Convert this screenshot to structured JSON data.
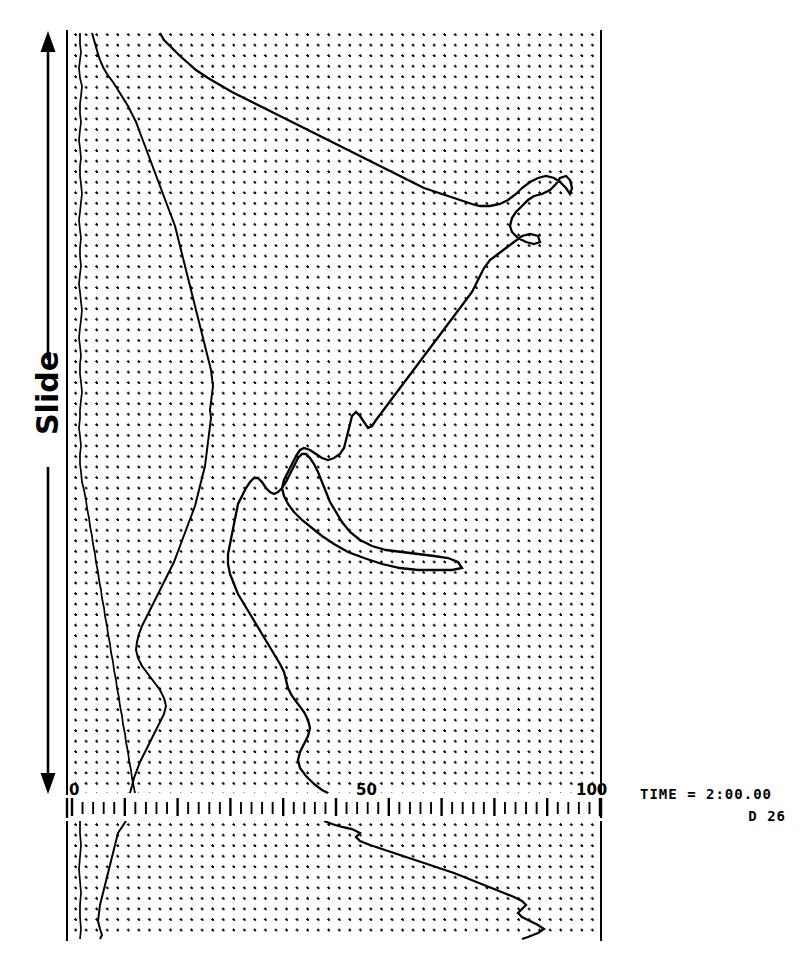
{
  "figure": {
    "kind": "vertical-profile-plot",
    "left_axis_label": "Slide",
    "annotation": {
      "time_label": "TIME = 2:00.00",
      "frame_label": "D  26"
    },
    "ink_color": "#000000",
    "background_color": "#ffffff",
    "grid": {
      "style": "dotted",
      "dot_spacing_px": 10.55,
      "visible": true
    }
  },
  "chart_data": {
    "type": "line",
    "title": "",
    "xlabel": "",
    "ylabel": "Slide",
    "xlim": [
      0,
      100
    ],
    "ylim": [
      0,
      1
    ],
    "grid": true,
    "legend_position": "none",
    "orientation": "vertical-profile",
    "xticks": [
      0,
      10,
      20,
      30,
      40,
      50,
      60,
      70,
      80,
      90,
      100
    ],
    "xtick_labels": [
      "0",
      "",
      "",
      "",
      "",
      "50",
      "",
      "",
      "",
      "",
      "100"
    ],
    "minor_tick_interval": 2,
    "major_tick_interval": 10,
    "series": [
      {
        "name": "profile-a",
        "description": "near-zero left curve",
        "x": [
          1.6,
          1.6,
          1.7,
          1.6,
          1.5,
          1.6,
          1.8,
          1.7,
          1.6,
          1.6,
          1.7,
          1.6,
          1.5,
          1.6,
          1.7,
          1.6,
          1.6,
          1.7,
          1.8,
          1.7,
          1.6,
          1.5,
          1.6,
          1.7,
          1.6,
          1.6,
          1.7,
          1.6,
          1.5,
          1.6,
          1.7,
          1.8,
          1.7,
          1.6,
          1.5,
          1.6,
          1.7,
          1.6,
          1.6,
          1.7,
          1.8,
          1.7,
          1.6,
          1.6,
          1.5,
          1.6,
          1.7,
          1.6,
          1.6,
          1.7,
          1.8,
          2.0,
          2.2,
          2.4,
          2.6,
          2.8,
          3.0,
          3.2,
          3.4,
          3.6,
          3.8,
          4.0,
          4.2,
          4.4,
          4.6,
          4.8,
          5.0,
          5.2,
          5.4,
          5.6,
          5.8,
          6.0,
          6.2,
          6.4,
          6.6,
          6.8,
          7.0,
          7.2
        ],
        "y": [
          0.0,
          0.013,
          0.026,
          0.039,
          0.052,
          0.065,
          0.078,
          0.091,
          0.104,
          0.117,
          0.13,
          0.143,
          0.156,
          0.169,
          0.182,
          0.195,
          0.208,
          0.221,
          0.234,
          0.247,
          0.26,
          0.273,
          0.286,
          0.299,
          0.312,
          0.325,
          0.338,
          0.351,
          0.364,
          0.377,
          0.39,
          0.403,
          0.416,
          0.429,
          0.442,
          0.455,
          0.468,
          0.481,
          0.494,
          0.507,
          0.52,
          0.533,
          0.546,
          0.559,
          0.572,
          0.585,
          0.598,
          0.611,
          0.624,
          0.637,
          0.65,
          0.663,
          0.676,
          0.689,
          0.702,
          0.715,
          0.728,
          0.741,
          0.754,
          0.767,
          0.78,
          0.793,
          0.806,
          0.819,
          0.832,
          0.845,
          0.858,
          0.871,
          0.884,
          0.897,
          0.91,
          0.923,
          0.936,
          0.949,
          0.962,
          0.975,
          0.988,
          1.0
        ]
      },
      {
        "name": "profile-b",
        "description": "middle meandering curve",
        "x": [
          4.0,
          5.0,
          6.5,
          7.0,
          8.5,
          10.0,
          11.5,
          12.5,
          13.5,
          14.5,
          15.5,
          16.5,
          17.0,
          17.5,
          18.0,
          18.5,
          19.0,
          19.5,
          20.0,
          20.5,
          21.0,
          21.5,
          22.0,
          22.5,
          23.0,
          23.5,
          24.0,
          23.5,
          23.0,
          22.5,
          22.0,
          21.5,
          21.0,
          20.5,
          20.0,
          19.5,
          19.0,
          18.5,
          18.0,
          17.5,
          17.0,
          16.5,
          16.0,
          15.5,
          15.0,
          14.5,
          14.0,
          13.5,
          13.0,
          12.5,
          12.0,
          11.5,
          11.0,
          10.5,
          10.0,
          9.5,
          9.0,
          9.5,
          10.5,
          12.0,
          14.0,
          16.0,
          17.5,
          18.0,
          17.0,
          16.0,
          15.0,
          14.5,
          14.0,
          13.5,
          13.0,
          12.5,
          12.0,
          11.5,
          11.0,
          10.5,
          10.0,
          9.0
        ],
        "y": [
          0.0,
          0.013,
          0.026,
          0.039,
          0.052,
          0.065,
          0.078,
          0.091,
          0.104,
          0.117,
          0.13,
          0.143,
          0.156,
          0.169,
          0.182,
          0.195,
          0.208,
          0.221,
          0.234,
          0.247,
          0.26,
          0.273,
          0.286,
          0.299,
          0.312,
          0.325,
          0.338,
          0.351,
          0.364,
          0.377,
          0.39,
          0.403,
          0.416,
          0.429,
          0.442,
          0.455,
          0.468,
          0.481,
          0.494,
          0.507,
          0.52,
          0.533,
          0.546,
          0.559,
          0.572,
          0.585,
          0.598,
          0.611,
          0.624,
          0.637,
          0.65,
          0.663,
          0.676,
          0.689,
          0.702,
          0.715,
          0.728,
          0.741,
          0.754,
          0.767,
          0.78,
          0.793,
          0.806,
          0.819,
          0.832,
          0.845,
          0.858,
          0.871,
          0.884,
          0.897,
          0.91,
          0.923,
          0.936,
          0.949,
          0.962,
          0.975,
          0.988,
          1.0
        ]
      },
      {
        "name": "profile-c",
        "description": "main large-amplitude curve",
        "x": [
          18.5,
          22.0,
          26.0,
          30.0,
          34.0,
          38.0,
          42.0,
          46.0,
          50.0,
          54.0,
          58.0,
          62.0,
          66.0,
          70.0,
          74.0,
          78.0,
          82.0,
          86.0,
          90.0,
          94.0,
          96.0,
          92.0,
          88.0,
          90.0,
          86.0,
          82.0,
          78.0,
          80.0,
          76.0,
          72.0,
          70.0,
          68.0,
          66.0,
          63.0,
          60.0,
          57.0,
          55.0,
          53.0,
          51.0,
          49.0,
          47.0,
          45.0,
          43.0,
          41.0,
          40.0,
          42.0,
          44.0,
          42.0,
          40.0,
          38.0,
          36.0,
          34.0,
          33.0,
          35.0,
          40.0,
          46.0,
          52.0,
          58.0,
          62.0,
          60.0,
          55.0,
          48.0,
          42.0,
          38.0,
          34.0,
          31.0,
          29.0,
          28.0,
          27.5,
          27.0,
          28.0,
          30.0,
          32.0,
          34.0,
          36.0,
          38.0,
          40.0,
          42.0
        ],
        "y": [
          0.0,
          0.013,
          0.026,
          0.039,
          0.052,
          0.065,
          0.078,
          0.091,
          0.104,
          0.117,
          0.13,
          0.143,
          0.156,
          0.169,
          0.182,
          0.195,
          0.208,
          0.221,
          0.234,
          0.247,
          0.26,
          0.273,
          0.286,
          0.299,
          0.312,
          0.325,
          0.338,
          0.351,
          0.364,
          0.377,
          0.39,
          0.403,
          0.416,
          0.429,
          0.442,
          0.455,
          0.468,
          0.481,
          0.494,
          0.507,
          0.52,
          0.533,
          0.546,
          0.559,
          0.572,
          0.585,
          0.598,
          0.611,
          0.624,
          0.637,
          0.65,
          0.663,
          0.676,
          0.689,
          0.702,
          0.715,
          0.728,
          0.741,
          0.754,
          0.767,
          0.78,
          0.793,
          0.806,
          0.819,
          0.832,
          0.845,
          0.858,
          0.871,
          0.884,
          0.897,
          0.91,
          0.923,
          0.936,
          0.949,
          0.962,
          0.975,
          0.988,
          1.0
        ]
      }
    ],
    "lower_panel": {
      "series": [
        {
          "name": "lower-profile-a",
          "x": [
            1.7,
            1.7,
            1.6,
            1.7,
            1.6,
            1.7,
            1.6,
            1.7,
            1.6,
            1.7,
            1.6,
            1.7
          ],
          "y": [
            0.0,
            0.09,
            0.18,
            0.27,
            0.36,
            0.45,
            0.54,
            0.63,
            0.72,
            0.81,
            0.9,
            1.0
          ]
        },
        {
          "name": "lower-profile-b",
          "x": [
            8.5,
            8.0,
            7.5,
            7.0,
            7.5,
            8.0,
            8.5,
            9.0,
            9.5,
            10.0,
            10.5,
            11.0
          ],
          "y": [
            0.0,
            0.09,
            0.18,
            0.27,
            0.36,
            0.45,
            0.54,
            0.63,
            0.72,
            0.81,
            0.9,
            1.0
          ]
        },
        {
          "name": "lower-profile-c",
          "x": [
            45.0,
            48.0,
            50.0,
            53.0,
            58.0,
            64.0,
            70.0,
            76.0,
            82.0,
            86.0,
            84.0,
            88.0
          ],
          "y": [
            0.0,
            0.09,
            0.18,
            0.27,
            0.36,
            0.45,
            0.54,
            0.63,
            0.72,
            0.81,
            0.9,
            1.0
          ]
        }
      ]
    }
  }
}
